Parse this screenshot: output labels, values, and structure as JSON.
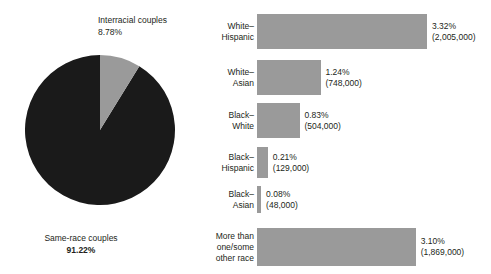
{
  "chart_data": {
    "type": "pie",
    "title": "",
    "categories": [
      "Same-race couples",
      "Interracial couples"
    ],
    "values": [
      91.22,
      8.78
    ],
    "value_unit": "%",
    "legend": "none",
    "grid": false,
    "companion": {
      "type": "bar",
      "orientation": "horizontal",
      "categories": [
        "White–Hispanic",
        "White–Asian",
        "Black–White",
        "Black–Hispanic",
        "Black–Asian",
        "More than one/some other race"
      ],
      "values": [
        3.32,
        1.24,
        0.83,
        0.21,
        0.08,
        3.1
      ],
      "counts": [
        2005000,
        748000,
        504000,
        129000,
        48000,
        1869000
      ],
      "value_unit": "%",
      "xlim": [
        0,
        3.32
      ],
      "grid": false,
      "legend": "none"
    }
  },
  "pie": {
    "slices": [
      {
        "name": "same-race",
        "label": "Same-race couples",
        "percent_text": "91.22%",
        "value": 91.22,
        "color": "#1a1a1a",
        "bold": true
      },
      {
        "name": "interracial",
        "label": "Interracial couples",
        "percent_text": "8.78%",
        "value": 8.78,
        "color": "#9a9a9a",
        "bold": false
      }
    ]
  },
  "bars": {
    "color": "#9a9a9a",
    "items": [
      {
        "label_line1": "White–",
        "label_line2": "Hispanic",
        "label_line3": "",
        "percent_text": "3.32%",
        "count_text": "(2,005,000)",
        "value": 3.32,
        "count": 2005000
      },
      {
        "label_line1": "White–",
        "label_line2": "Asian",
        "label_line3": "",
        "percent_text": "1.24%",
        "count_text": "(748,000)",
        "value": 1.24,
        "count": 748000
      },
      {
        "label_line1": "Black–",
        "label_line2": "White",
        "label_line3": "",
        "percent_text": "0.83%",
        "count_text": "(504,000)",
        "value": 0.83,
        "count": 504000
      },
      {
        "label_line1": "Black–",
        "label_line2": "Hispanic",
        "label_line3": "",
        "percent_text": "0.21%",
        "count_text": "(129,000)",
        "value": 0.21,
        "count": 129000
      },
      {
        "label_line1": "Black–",
        "label_line2": "Asian",
        "label_line3": "",
        "percent_text": "0.08%",
        "count_text": "(48,000)",
        "value": 0.08,
        "count": 48000
      },
      {
        "label_line1": "More than",
        "label_line2": "one/some",
        "label_line3": "other race",
        "percent_text": "3.10%",
        "count_text": "(1,869,000)",
        "value": 3.1,
        "count": 1869000
      }
    ],
    "geometry": {
      "bar_left": 61,
      "max_bar_width": 170,
      "max_value": 3.32,
      "rows": [
        {
          "top": 14,
          "height": 35
        },
        {
          "top": 60,
          "height": 35
        },
        {
          "top": 103,
          "height": 35
        },
        {
          "top": 147,
          "height": 31
        },
        {
          "top": 186,
          "height": 27
        },
        {
          "top": 228,
          "height": 38
        }
      ]
    }
  }
}
